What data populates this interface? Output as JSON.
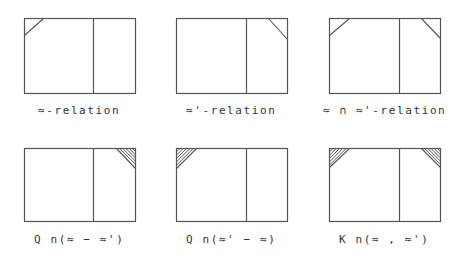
{
  "colors": {
    "line": "#555555",
    "text": "#333333",
    "background": "#ffffff"
  },
  "panels": [
    {
      "id": "approx-relation",
      "label": "≈-relation",
      "row": 0,
      "col": 0,
      "box": {
        "x1": 24,
        "y1": 18,
        "x2": 135,
        "y2": 93,
        "divider_x": 93
      },
      "corners": [
        {
          "position": "top-left",
          "style": "line",
          "size_x": 19,
          "size_y": 17
        }
      ]
    },
    {
      "id": "approx-prime-relation",
      "label": "≈'-relation",
      "row": 0,
      "col": 1,
      "box": {
        "x1": 176,
        "y1": 18,
        "x2": 287,
        "y2": 93,
        "divider_x": 246
      },
      "corners": [
        {
          "position": "top-right",
          "style": "line",
          "size_x": 19,
          "size_y": 21
        }
      ]
    },
    {
      "id": "intersection-relation",
      "label": "≈ ∩ ≈'-relation",
      "row": 0,
      "col": 2,
      "box": {
        "x1": 329,
        "y1": 18,
        "x2": 440,
        "y2": 93,
        "divider_x": 399
      },
      "corners": [
        {
          "position": "top-left",
          "style": "line",
          "size_x": 20,
          "size_y": 17
        },
        {
          "position": "top-right",
          "style": "line",
          "size_x": 19,
          "size_y": 20
        }
      ]
    },
    {
      "id": "q-difference-1",
      "label": "Q n(≈ − ≈')",
      "row": 1,
      "col": 0,
      "box": {
        "x1": 24,
        "y1": 148,
        "x2": 135,
        "y2": 221,
        "divider_x": 93
      },
      "corners": [
        {
          "position": "top-right",
          "style": "hatched",
          "size_x": 19,
          "size_y": 20
        }
      ]
    },
    {
      "id": "q-difference-2",
      "label": "Q n(≈' − ≈)",
      "row": 1,
      "col": 1,
      "box": {
        "x1": 176,
        "y1": 148,
        "x2": 287,
        "y2": 221,
        "divider_x": 246
      },
      "corners": [
        {
          "position": "top-left",
          "style": "hatched",
          "size_x": 20,
          "size_y": 20
        }
      ]
    },
    {
      "id": "k-pair",
      "label": "K n(≈ , ≈')",
      "row": 1,
      "col": 2,
      "box": {
        "x1": 329,
        "y1": 148,
        "x2": 440,
        "y2": 221,
        "divider_x": 399
      },
      "corners": [
        {
          "position": "top-left",
          "style": "hatched",
          "size_x": 20,
          "size_y": 19
        },
        {
          "position": "top-right",
          "style": "hatched",
          "size_x": 19,
          "size_y": 19
        }
      ]
    }
  ],
  "label_positions": {
    "row0_top": 104,
    "row1_top": 233
  }
}
